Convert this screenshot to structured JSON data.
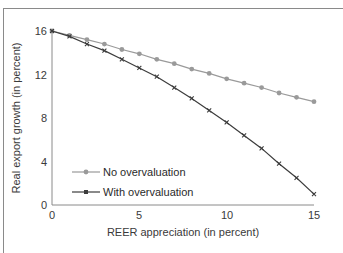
{
  "chart_data": {
    "type": "line",
    "title": "",
    "xlabel": "REER appreciation (in percent)",
    "ylabel": "Real export growth (in percent)",
    "x": [
      0,
      1,
      2,
      3,
      4,
      5,
      6,
      7,
      8,
      9,
      10,
      11,
      12,
      13,
      14,
      15
    ],
    "xlim": [
      0,
      15
    ],
    "ylim": [
      0,
      16
    ],
    "xticks": [
      0,
      5,
      10,
      15
    ],
    "yticks": [
      0,
      4,
      8,
      12,
      16
    ],
    "grid": false,
    "legend_position": "lower left (inside)",
    "series": [
      {
        "name": "No overvaluation",
        "color": "#9a9a9a",
        "marker": "circle",
        "values": [
          16.0,
          15.6,
          15.2,
          14.8,
          14.3,
          13.9,
          13.4,
          13.0,
          12.5,
          12.1,
          11.6,
          11.2,
          10.8,
          10.3,
          9.9,
          9.5
        ]
      },
      {
        "name": "With overvaluation",
        "color": "#3c3c3c",
        "marker": "x-square",
        "values": [
          16.0,
          15.5,
          14.8,
          14.2,
          13.4,
          12.6,
          11.8,
          10.8,
          9.8,
          8.7,
          7.6,
          6.4,
          5.2,
          3.8,
          2.5,
          1.0
        ]
      }
    ]
  },
  "axis": {
    "xtick_labels": [
      "0",
      "5",
      "10",
      "15"
    ],
    "ytick_labels": [
      "0",
      "4",
      "8",
      "12",
      "16"
    ]
  },
  "legend": {
    "items": [
      {
        "label": "No overvaluation"
      },
      {
        "label": "With overvaluation"
      }
    ]
  }
}
